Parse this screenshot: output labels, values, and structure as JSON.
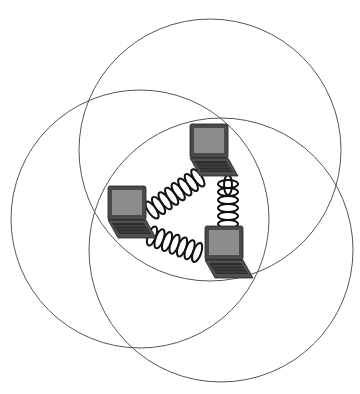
{
  "diagram": {
    "type": "wireless ad-hoc network",
    "circles": [
      {
        "name": "range-top",
        "cx": 210,
        "cy": 150,
        "r": 131
      },
      {
        "name": "range-left",
        "cx": 140,
        "cy": 219,
        "r": 129
      },
      {
        "name": "range-right",
        "cx": 221,
        "cy": 250,
        "r": 132
      }
    ],
    "nodes": [
      {
        "name": "laptop-top",
        "x": 190,
        "y": 124
      },
      {
        "name": "laptop-left",
        "x": 108,
        "y": 186
      },
      {
        "name": "laptop-right",
        "x": 205,
        "y": 225
      }
    ],
    "links": [
      {
        "from": "laptop-left",
        "to": "laptop-top"
      },
      {
        "from": "laptop-top",
        "to": "laptop-right"
      },
      {
        "from": "laptop-left",
        "to": "laptop-right"
      }
    ],
    "colors": {
      "circle": "#555555",
      "laptop_body": "#4a4a4a",
      "screen": "#8a8a8a",
      "coil": "#111111"
    }
  }
}
